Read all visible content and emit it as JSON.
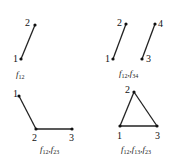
{
  "panels": [
    {
      "nodes": [
        {
          "id": "1",
          "x": 21,
          "y": 59,
          "lx": 13,
          "ly": 62
        },
        {
          "id": "2",
          "x": 35,
          "y": 25,
          "lx": 25,
          "ly": 26
        }
      ],
      "edges": [
        [
          "1",
          "2"
        ]
      ],
      "caption": {
        "f": "f",
        "subs": [
          "12"
        ],
        "x": 16,
        "y": 77
      }
    },
    {
      "nodes": [
        {
          "id": "1",
          "x": 113,
          "y": 59,
          "lx": 105,
          "ly": 62
        },
        {
          "id": "2",
          "x": 126,
          "y": 24,
          "lx": 117,
          "ly": 26
        },
        {
          "id": "3",
          "x": 142,
          "y": 59,
          "lx": 146,
          "ly": 62
        },
        {
          "id": "4",
          "x": 155,
          "y": 24,
          "lx": 158,
          "ly": 27
        }
      ],
      "edges": [
        [
          "1",
          "2"
        ],
        [
          "3",
          "4"
        ]
      ],
      "caption": {
        "f": "f",
        "subs": [
          "12",
          "34"
        ],
        "x": 119,
        "y": 76
      }
    },
    {
      "nodes": [
        {
          "id": "1",
          "x": 19,
          "y": 96,
          "lx": 13,
          "ly": 97
        },
        {
          "id": "2",
          "x": 36,
          "y": 129,
          "lx": 32,
          "ly": 141
        },
        {
          "id": "3",
          "x": 72,
          "y": 129,
          "lx": 69,
          "ly": 141
        },
        {
          "id": "_",
          "x": -10,
          "y": -10,
          "lx": -10,
          "ly": -10
        }
      ],
      "edges": [
        [
          "1",
          "2"
        ],
        [
          "2",
          "3"
        ]
      ],
      "caption": {
        "f": "f",
        "subs": [
          "12",
          "23"
        ],
        "x": 40,
        "y": 152
      }
    },
    {
      "nodes": [
        {
          "id": "1",
          "x": 120,
          "y": 126,
          "lx": 117,
          "ly": 139
        },
        {
          "id": "2",
          "x": 134,
          "y": 92,
          "lx": 125,
          "ly": 93
        },
        {
          "id": "3",
          "x": 157,
          "y": 126,
          "lx": 155,
          "ly": 139
        }
      ],
      "edges": [
        [
          "1",
          "2"
        ],
        [
          "2",
          "3"
        ],
        [
          "1",
          "3"
        ]
      ],
      "caption": {
        "f": "f",
        "subs": [
          "12",
          "13",
          "23"
        ],
        "x": 121,
        "y": 152
      }
    }
  ]
}
